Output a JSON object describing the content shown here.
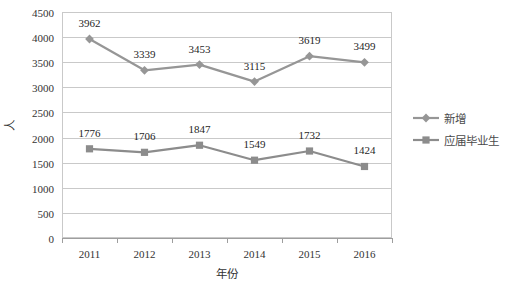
{
  "chart_data": {
    "type": "line",
    "title": "",
    "xlabel": "年份",
    "ylabel": "人",
    "categories": [
      "2011",
      "2012",
      "2013",
      "2014",
      "2015",
      "2016"
    ],
    "series": [
      {
        "name": "新增",
        "marker": "diamond",
        "color": "#969696",
        "values": [
          3962,
          3339,
          3453,
          3115,
          3619,
          3499
        ]
      },
      {
        "name": "应届毕业生",
        "marker": "square",
        "color": "#8c8c8c",
        "values": [
          1776,
          1706,
          1847,
          1549,
          1732,
          1424
        ]
      }
    ],
    "ylim": [
      0,
      4500
    ],
    "ytick_step": 500,
    "yticks": [
      "0",
      "500",
      "1000",
      "1500",
      "2000",
      "2500",
      "3000",
      "3500",
      "4000",
      "4500"
    ],
    "grid": true,
    "legend_position": "right",
    "data_labels_shown": true,
    "colors": {
      "gridline": "#c9c9c9",
      "axis": "#9e9e9e",
      "text": "#333333",
      "background": "#ffffff"
    }
  }
}
